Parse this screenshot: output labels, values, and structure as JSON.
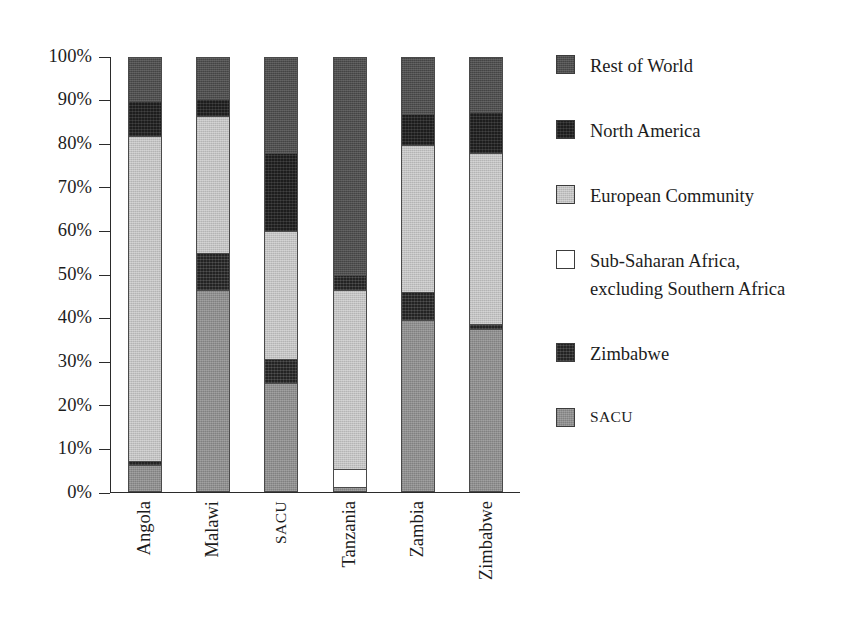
{
  "chart_data": {
    "type": "bar",
    "subtype": "stacked-percentage",
    "title": "",
    "xlabel": "",
    "ylabel": "",
    "ylim": [
      0,
      100
    ],
    "grid": false,
    "legend_position": "right",
    "categories": [
      "Angola",
      "Malawi",
      "SACU",
      "Tanzania",
      "Zambia",
      "Zimbabwe"
    ],
    "ytick_labels": [
      "100%",
      "90%",
      "80%",
      "70%",
      "60%",
      "50%",
      "40%",
      "30%",
      "20%",
      "10%",
      "0%"
    ],
    "ytick_values": [
      100,
      90,
      80,
      70,
      60,
      50,
      40,
      30,
      20,
      10,
      0
    ],
    "series": [
      {
        "name": "Rest of World",
        "key": "row",
        "color": "#4f4f4f",
        "values": [
          10.0,
          9.5,
          22.0,
          50.0,
          13.0,
          12.5
        ]
      },
      {
        "name": "North America",
        "key": "na",
        "color": "#1d1d1d",
        "values": [
          8.0,
          4.0,
          18.0,
          0.0,
          7.0,
          9.5
        ]
      },
      {
        "name": "European Community",
        "key": "ec",
        "color": "#c2c2c2",
        "values": [
          75.0,
          31.5,
          29.5,
          41.5,
          34.0,
          39.5
        ]
      },
      {
        "name": "Sub-Saharan Africa, excluding Southern Africa",
        "key": "ssa",
        "color": "#ffffff",
        "values": [
          0.0,
          0.0,
          0.0,
          4.0,
          0.0,
          0.0
        ]
      },
      {
        "name": "Zimbabwe",
        "key": "zw",
        "color": "#232323",
        "values": [
          1.0,
          8.5,
          5.5,
          3.5,
          6.5,
          1.0
        ]
      },
      {
        "name": "SACU",
        "key": "sacu",
        "color": "#8f8f8f",
        "values": [
          6.0,
          46.5,
          25.0,
          1.0,
          39.5,
          37.5
        ]
      }
    ],
    "stack_order_top_to_bottom": [
      "Rest of World",
      "North America",
      "European Community",
      "Sub-Saharan Africa, excluding Southern Africa",
      "Zimbabwe",
      "SACU"
    ],
    "bars": [
      {
        "category": "Angola",
        "segments": [
          {
            "name": "Rest of World",
            "key": "row",
            "from": 100.0,
            "to": 90.0,
            "value": 10.0
          },
          {
            "name": "North America",
            "key": "na",
            "from": 90.0,
            "to": 82.0,
            "value": 8.0
          },
          {
            "name": "European Community",
            "key": "ec",
            "from": 82.0,
            "to": 7.0,
            "value": 75.0
          },
          {
            "name": "Zimbabwe",
            "key": "zw",
            "from": 7.0,
            "to": 6.0,
            "value": 1.0
          },
          {
            "name": "SACU",
            "key": "sacu",
            "from": 6.0,
            "to": 0.0,
            "value": 6.0
          }
        ]
      },
      {
        "category": "Malawi",
        "segments": [
          {
            "name": "Rest of World",
            "key": "row",
            "from": 100.0,
            "to": 90.5,
            "value": 9.5
          },
          {
            "name": "North America",
            "key": "na",
            "from": 90.5,
            "to": 86.5,
            "value": 4.0
          },
          {
            "name": "European Community",
            "key": "ec",
            "from": 86.5,
            "to": 55.0,
            "value": 31.5
          },
          {
            "name": "Zimbabwe",
            "key": "zw",
            "from": 55.0,
            "to": 46.5,
            "value": 8.5
          },
          {
            "name": "SACU",
            "key": "sacu",
            "from": 46.5,
            "to": 0.0,
            "value": 46.5
          }
        ]
      },
      {
        "category": "SACU",
        "segments": [
          {
            "name": "Rest of World",
            "key": "row",
            "from": 100.0,
            "to": 78.0,
            "value": 22.0
          },
          {
            "name": "North America",
            "key": "na",
            "from": 78.0,
            "to": 60.0,
            "value": 18.0
          },
          {
            "name": "European Community",
            "key": "ec",
            "from": 60.0,
            "to": 30.5,
            "value": 29.5
          },
          {
            "name": "Zimbabwe",
            "key": "zw",
            "from": 30.5,
            "to": 25.0,
            "value": 5.5
          },
          {
            "name": "SACU",
            "key": "sacu",
            "from": 25.0,
            "to": 0.0,
            "value": 25.0
          }
        ]
      },
      {
        "category": "Tanzania",
        "segments": [
          {
            "name": "Rest of World",
            "key": "row",
            "from": 100.0,
            "to": 50.0,
            "value": 50.0
          },
          {
            "name": "Zimbabwe",
            "key": "zw",
            "from": 50.0,
            "to": 46.5,
            "value": 3.5
          },
          {
            "name": "European Community",
            "key": "ec",
            "from": 46.5,
            "to": 5.0,
            "value": 41.5
          },
          {
            "name": "Sub-Saharan Africa, excluding Southern Africa",
            "key": "ssa",
            "from": 5.0,
            "to": 1.0,
            "value": 4.0
          },
          {
            "name": "SACU",
            "key": "sacu",
            "from": 1.0,
            "to": 0.0,
            "value": 1.0
          }
        ]
      },
      {
        "category": "Zambia",
        "segments": [
          {
            "name": "Rest of World",
            "key": "row",
            "from": 100.0,
            "to": 87.0,
            "value": 13.0
          },
          {
            "name": "North America",
            "key": "na",
            "from": 87.0,
            "to": 80.0,
            "value": 7.0
          },
          {
            "name": "European Community",
            "key": "ec",
            "from": 80.0,
            "to": 46.0,
            "value": 34.0
          },
          {
            "name": "Zimbabwe",
            "key": "zw",
            "from": 46.0,
            "to": 39.5,
            "value": 6.5
          },
          {
            "name": "SACU",
            "key": "sacu",
            "from": 39.5,
            "to": 0.0,
            "value": 39.5
          }
        ]
      },
      {
        "category": "Zimbabwe",
        "segments": [
          {
            "name": "Rest of World",
            "key": "row",
            "from": 100.0,
            "to": 87.5,
            "value": 12.5
          },
          {
            "name": "North America",
            "key": "na",
            "from": 87.5,
            "to": 78.0,
            "value": 9.5
          },
          {
            "name": "European Community",
            "key": "ec",
            "from": 78.0,
            "to": 38.5,
            "value": 39.5
          },
          {
            "name": "Zimbabwe",
            "key": "zw",
            "from": 38.5,
            "to": 37.5,
            "value": 1.0
          },
          {
            "name": "SACU",
            "key": "sacu",
            "from": 37.5,
            "to": 0.0,
            "value": 37.5
          }
        ]
      }
    ]
  },
  "legend": {
    "items": [
      {
        "label": "Rest of World",
        "key": "row",
        "color": "#4f4f4f",
        "smallcaps": false,
        "line2": ""
      },
      {
        "label": "North America",
        "key": "na",
        "color": "#1d1d1d",
        "smallcaps": false,
        "line2": ""
      },
      {
        "label": "European Community",
        "key": "ec",
        "color": "#c2c2c2",
        "smallcaps": false,
        "line2": ""
      },
      {
        "label": "Sub-Saharan Africa,",
        "key": "ssa",
        "color": "#ffffff",
        "smallcaps": false,
        "line2": "excluding Southern Africa"
      },
      {
        "label": "Zimbabwe",
        "key": "zw",
        "color": "#232323",
        "smallcaps": false,
        "line2": ""
      },
      {
        "label": "SACU",
        "key": "sacu",
        "color": "#8f8f8f",
        "smallcaps": true,
        "line2": ""
      }
    ]
  }
}
